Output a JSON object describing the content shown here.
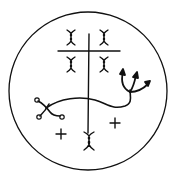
{
  "figure": {
    "background": "#ffffff",
    "stroke_color": "#111111",
    "elements": [
      "outer-circle",
      "vertical-staff",
      "crossbar",
      "four-x-glyphs-upper",
      "bottom-x-glyph",
      "trident",
      "wavy-serpent-line",
      "two-crosses"
    ]
  }
}
